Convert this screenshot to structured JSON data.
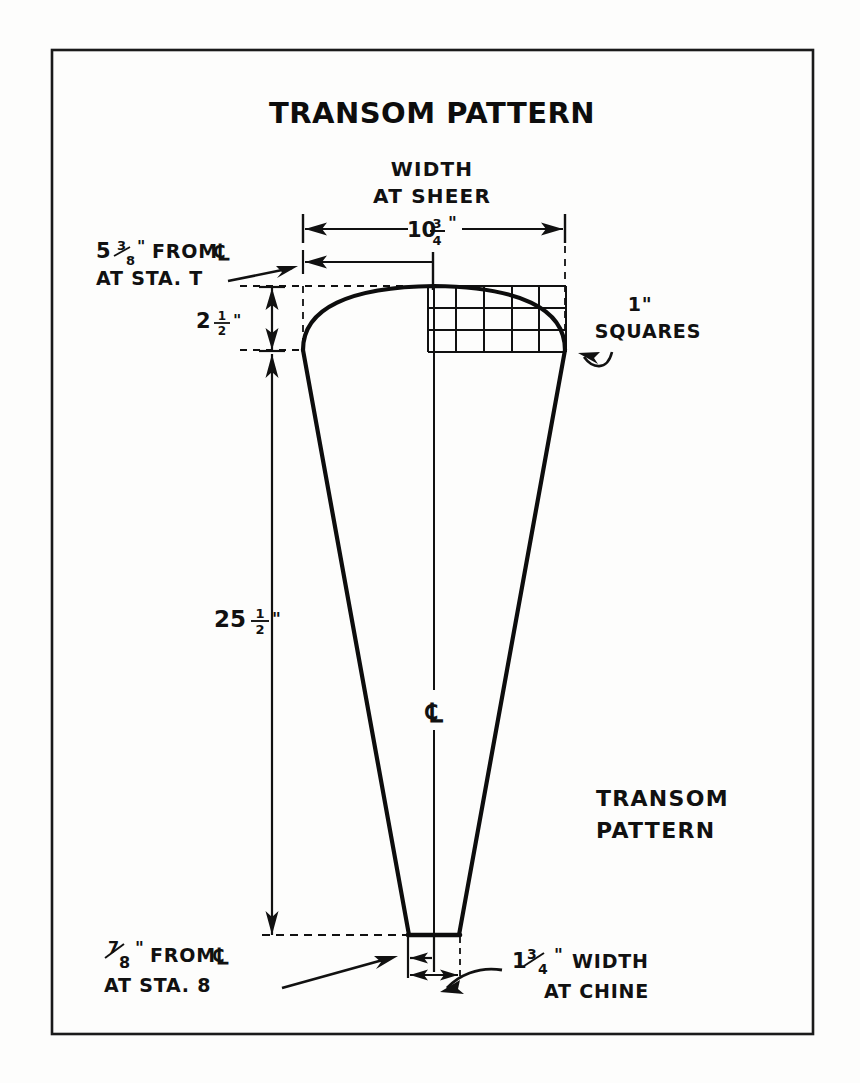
{
  "page": {
    "background_color": "#fdfdfc",
    "ink_color": "#111111",
    "frame": {
      "x": 52,
      "y": 50,
      "width": 761,
      "height": 984
    }
  },
  "title": {
    "text": "TRANSOM PATTERN",
    "style": "bold-sans-caps"
  },
  "drawing_label": {
    "line1": "TRANSOM",
    "line2": "PATTERN"
  },
  "annotations": {
    "width_at_sheer": {
      "line1": "WIDTH",
      "line2": "AT SHEER",
      "value_whole": "10",
      "value_num": "3",
      "value_den": "4",
      "value_unit": "\""
    },
    "sta_t_offset": {
      "whole": "5",
      "num": "3",
      "den": "8",
      "unit": "\"",
      "from_text": "FROM",
      "centerline_symbol": "℄",
      "line2": "AT STA. T"
    },
    "sheer_drop": {
      "whole": "2",
      "num": "1",
      "den": "2",
      "unit": "\""
    },
    "height": {
      "whole": "25",
      "num": "1",
      "den": "2",
      "unit": "\""
    },
    "squares": {
      "line1": "1\"",
      "line2": "SQUARES",
      "grid_columns": 5,
      "grid_rows": 3,
      "square_size_label": "1\""
    },
    "sta_8_offset": {
      "num": "7",
      "den": "8",
      "unit": "\"",
      "from_text": "FROM",
      "centerline_symbol": "℄",
      "line2": "AT STA. 8"
    },
    "chine_width": {
      "whole": "1",
      "num": "3",
      "den": "4",
      "unit": "\"",
      "line1_tail": "WIDTH",
      "line2": "AT CHINE"
    },
    "centerline_mark": {
      "symbol": "℄"
    }
  },
  "geometry": {
    "centerline_x": 434,
    "sheer_top_y": 286,
    "sheer_corner_y": 350,
    "chine_y": 935,
    "half_width_at_sheer": 131,
    "half_width_at_chine": 25,
    "grid": {
      "x": 428,
      "y": 286,
      "cols": 5,
      "rows": 3,
      "cell": 22
    }
  }
}
